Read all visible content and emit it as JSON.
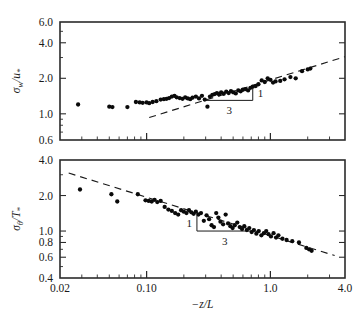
{
  "figure": {
    "xlabel": "−z/L",
    "background_color": "#ffffff",
    "marker_color": "#0a0a0a",
    "line_color": "#1a1a1a"
  },
  "chart_data": [
    {
      "type": "scatter",
      "panel": "top",
      "title": "",
      "xlabel": "−z/L",
      "ylabel": "σ_w/u_*",
      "xscale": "log",
      "yscale": "log",
      "xlim": [
        0.02,
        4.0
      ],
      "ylim": [
        0.6,
        6.0
      ],
      "grid": false,
      "legend": null,
      "xticks": [
        0.02,
        0.1,
        1.0,
        4.0
      ],
      "xtick_labels": [
        "0.02",
        "0.10",
        "1.0",
        "4.0"
      ],
      "yticks": [
        0.6,
        1.0,
        2.0,
        4.0,
        6.0
      ],
      "ytick_labels": [
        "0.6",
        "1.0",
        "2.0",
        "4.0",
        "6.0"
      ],
      "annotations": [
        {
          "text": "1",
          "role": "slope-triangle-rise"
        },
        {
          "text": "3",
          "role": "slope-triangle-run"
        }
      ],
      "reference_line": {
        "style": "dashed",
        "slope_exponent": 0.3333,
        "x_start": 0.105,
        "x_end": 4.0,
        "y_start": 0.93,
        "y_end": 3.05
      },
      "slope_triangle": {
        "x1": 0.3,
        "x2": 0.72,
        "y_base": 1.3,
        "y_top": 1.74
      },
      "x": [
        0.028,
        0.05,
        0.053,
        0.07,
        0.082,
        0.088,
        0.093,
        0.1,
        0.105,
        0.112,
        0.12,
        0.13,
        0.138,
        0.145,
        0.152,
        0.16,
        0.168,
        0.175,
        0.185,
        0.195,
        0.205,
        0.215,
        0.225,
        0.235,
        0.25,
        0.265,
        0.28,
        0.295,
        0.31,
        0.325,
        0.34,
        0.355,
        0.37,
        0.385,
        0.4,
        0.42,
        0.44,
        0.46,
        0.48,
        0.5,
        0.525,
        0.55,
        0.575,
        0.6,
        0.63,
        0.66,
        0.69,
        0.72,
        0.76,
        0.8,
        0.85,
        0.9,
        0.95,
        1.0,
        1.05,
        1.1,
        1.2,
        1.3,
        1.45,
        1.6,
        1.8,
        2.0,
        2.1
      ],
      "y": [
        1.2,
        1.15,
        1.14,
        1.14,
        1.26,
        1.25,
        1.24,
        1.25,
        1.23,
        1.26,
        1.28,
        1.32,
        1.33,
        1.34,
        1.36,
        1.4,
        1.42,
        1.38,
        1.36,
        1.34,
        1.38,
        1.35,
        1.33,
        1.37,
        1.4,
        1.35,
        1.42,
        1.32,
        1.15,
        1.4,
        1.45,
        1.47,
        1.5,
        1.46,
        1.52,
        1.48,
        1.54,
        1.5,
        1.56,
        1.52,
        1.49,
        1.58,
        1.55,
        1.6,
        1.62,
        1.58,
        1.66,
        1.7,
        1.72,
        1.78,
        1.92,
        1.86,
        2.0,
        1.94,
        1.84,
        1.88,
        1.9,
        1.96,
        2.05,
        2.0,
        2.3,
        2.38,
        2.42
      ]
    },
    {
      "type": "scatter",
      "panel": "bottom",
      "title": "",
      "xlabel": "−z/L",
      "ylabel": "σ_θ/T_*",
      "xscale": "log",
      "yscale": "log",
      "xlim": [
        0.02,
        4.0
      ],
      "ylim": [
        0.4,
        4.0
      ],
      "grid": false,
      "legend": null,
      "xticks": [
        0.02,
        0.1,
        1.0,
        4.0
      ],
      "xtick_labels": [
        "0.02",
        "0.10",
        "1.0",
        "4.0"
      ],
      "yticks": [
        0.4,
        0.6,
        0.8,
        1.0,
        2.0,
        4.0
      ],
      "ytick_labels": [
        "0.4",
        "0.6",
        "0.8",
        "1.0",
        "2.0",
        "4.0"
      ],
      "annotations": [
        {
          "text": "1",
          "role": "slope-triangle-rise"
        },
        {
          "text": "3",
          "role": "slope-triangle-run"
        }
      ],
      "reference_line": {
        "style": "dashed",
        "slope_exponent": -0.3333,
        "x_start": 0.0235,
        "x_end": 3.3,
        "y_start": 3.1,
        "y_end": 0.62
      },
      "slope_triangle": {
        "x1": 0.255,
        "x2": 0.72,
        "y_base": 1.0,
        "y_top": 1.36
      },
      "x": [
        0.029,
        0.052,
        0.058,
        0.085,
        0.098,
        0.104,
        0.11,
        0.116,
        0.122,
        0.13,
        0.14,
        0.15,
        0.16,
        0.17,
        0.18,
        0.19,
        0.2,
        0.21,
        0.22,
        0.23,
        0.24,
        0.25,
        0.262,
        0.275,
        0.29,
        0.305,
        0.32,
        0.335,
        0.35,
        0.365,
        0.38,
        0.395,
        0.415,
        0.435,
        0.455,
        0.475,
        0.495,
        0.515,
        0.54,
        0.565,
        0.59,
        0.615,
        0.645,
        0.675,
        0.705,
        0.735,
        0.77,
        0.805,
        0.845,
        0.885,
        0.925,
        0.965,
        1.01,
        1.06,
        1.11,
        1.16,
        1.25,
        1.35,
        1.5,
        1.7,
        1.95,
        2.05,
        2.15
      ],
      "y": [
        2.25,
        2.05,
        1.78,
        2.05,
        1.82,
        1.8,
        1.78,
        1.84,
        1.76,
        1.8,
        1.6,
        1.52,
        1.48,
        1.42,
        1.38,
        1.5,
        1.46,
        1.42,
        1.5,
        1.44,
        1.4,
        1.46,
        1.38,
        1.42,
        1.22,
        1.36,
        1.26,
        1.12,
        1.08,
        1.42,
        1.3,
        1.2,
        1.14,
        1.38,
        1.16,
        1.1,
        1.06,
        1.12,
        1.18,
        1.08,
        1.04,
        1.1,
        1.02,
        1.06,
        0.98,
        1.02,
        0.95,
        1.0,
        0.92,
        0.96,
        1.0,
        0.94,
        0.9,
        0.96,
        0.88,
        0.92,
        0.86,
        0.84,
        0.82,
        0.8,
        0.72,
        0.7,
        0.68
      ]
    }
  ]
}
